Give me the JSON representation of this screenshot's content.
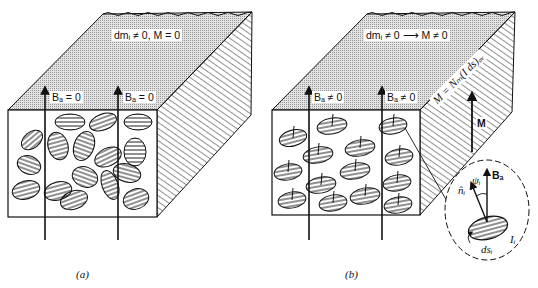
{
  "figure": {
    "panel_a": {
      "caption": "(a)",
      "top_label": "dmᵢ ≠ 0, M = 0",
      "field_labels": [
        "Bₐ = 0",
        "Bₐ = 0"
      ]
    },
    "panel_b": {
      "caption": "(b)",
      "top_label": "dmᵢ ≠ 0  ⟶  M ≠ 0",
      "field_labels": [
        "Bₐ ≠ 0",
        "Bₐ ≠ 0"
      ],
      "side_equation": "M = Nₘ(I ds)ₐᵥ",
      "side_arrow_label": "M",
      "inset": {
        "field": "Bₐ",
        "normal": "n̂ᵢ",
        "angle": "ψᵢ",
        "current": "Iᵢ",
        "area": "dsᵢ"
      }
    },
    "colors": {
      "top_face": "#d4d4d4",
      "line": "#111111",
      "background": "#ffffff"
    }
  }
}
